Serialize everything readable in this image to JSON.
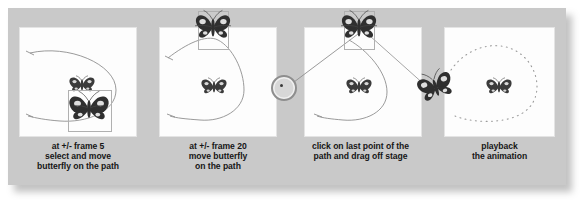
{
  "figure": {
    "background_color": "#c9c9c9",
    "card_color": "#fdfdfd",
    "path_color": "#8a8a8a",
    "text_color": "#161616"
  },
  "steps": [
    {
      "id": "step-1",
      "caption": "at +/- frame 5\nselect and move\nbutterfly on the path",
      "stage_name": "stage-frame-5",
      "path_style": "solid-curve",
      "butterflies": [
        {
          "name": "butterfly-small",
          "selected": false
        },
        {
          "name": "butterfly-selected",
          "selected": true
        }
      ]
    },
    {
      "id": "step-2",
      "caption": "at +/- frame 20\nmove butterfly\non the path",
      "stage_name": "stage-frame-20",
      "path_style": "solid-curve",
      "butterflies": [
        {
          "name": "butterfly-small",
          "selected": false
        },
        {
          "name": "butterfly-selected",
          "selected": true
        }
      ]
    },
    {
      "id": "step-3",
      "caption": "click on last point of the\npath and drag off stage",
      "stage_name": "stage-drag-off",
      "path_style": "solid-curve-with-drag-line",
      "butterflies": [
        {
          "name": "butterfly-small",
          "selected": false
        },
        {
          "name": "butterfly-selected",
          "selected": true
        }
      ]
    },
    {
      "id": "step-4",
      "caption": "playback\nthe animation",
      "stage_name": "stage-playback",
      "path_style": "dotted-loop",
      "butterflies": [
        {
          "name": "butterfly-small",
          "selected": false
        }
      ]
    }
  ],
  "annotations": {
    "cursor_marker": {
      "name": "cursor-ring-marker",
      "visible": true
    },
    "drag_butterfly": {
      "name": "butterfly-dragged-off-stage",
      "visible": true
    }
  }
}
